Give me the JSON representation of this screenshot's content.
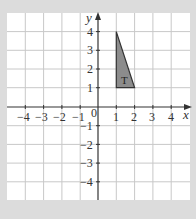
{
  "diagram": {
    "type": "coordinate-grid",
    "x_axis": {
      "label": "x",
      "min": -5,
      "max": 5,
      "ticks": [
        -4,
        -3,
        -2,
        -1,
        1,
        2,
        3,
        4
      ]
    },
    "y_axis": {
      "label": "y",
      "min": -5,
      "max": 5,
      "ticks": [
        4,
        3,
        2,
        1,
        -1,
        -2,
        -3,
        -4
      ]
    },
    "origin_label": "0",
    "shape": {
      "label": "T",
      "vertices": [
        [
          1,
          4
        ],
        [
          1,
          1
        ],
        [
          2,
          1
        ]
      ],
      "fill": "#8c8c8c",
      "stroke": "#333333"
    },
    "colors": {
      "background": "#dcdcdc",
      "grid_bg": "#ffffff",
      "grid_line": "#c8c8c8",
      "axis": "#333333"
    }
  },
  "labels": {
    "x_axis": "x",
    "y_axis": "y",
    "origin": "0",
    "shape": "T",
    "x_ticks": {
      "n4": "−4",
      "n3": "−3",
      "n2": "−2",
      "n1": "−1",
      "p1": "1",
      "p2": "2",
      "p3": "3",
      "p4": "4"
    },
    "y_ticks": {
      "p4": "4",
      "p3": "3",
      "p2": "2",
      "p1": "1",
      "n1": "−1",
      "n2": "−2",
      "n3": "−3",
      "n4": "−4"
    }
  }
}
